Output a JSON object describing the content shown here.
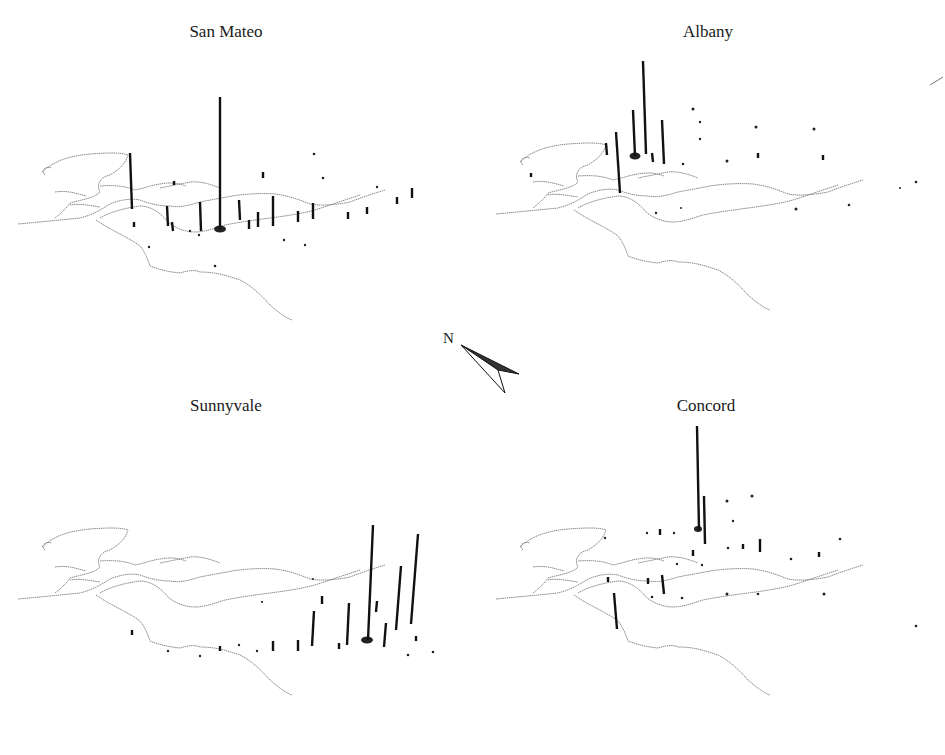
{
  "figure": {
    "panels": [
      {
        "id": "san-mateo",
        "title": "San Mateo",
        "origin_marker": [
          220,
          229
        ]
      },
      {
        "id": "albany",
        "title": "Albany",
        "origin_marker": [
          635,
          156
        ]
      },
      {
        "id": "sunnyvale",
        "title": "Sunnyvale",
        "origin_marker": [
          367,
          640
        ]
      },
      {
        "id": "concord",
        "title": "Concord",
        "origin_marker": [
          698,
          527
        ]
      }
    ],
    "compass": {
      "label": "N"
    },
    "colors": {
      "bars": "#111111",
      "coastline": "#8c8c8c",
      "background": "#ffffff"
    }
  }
}
